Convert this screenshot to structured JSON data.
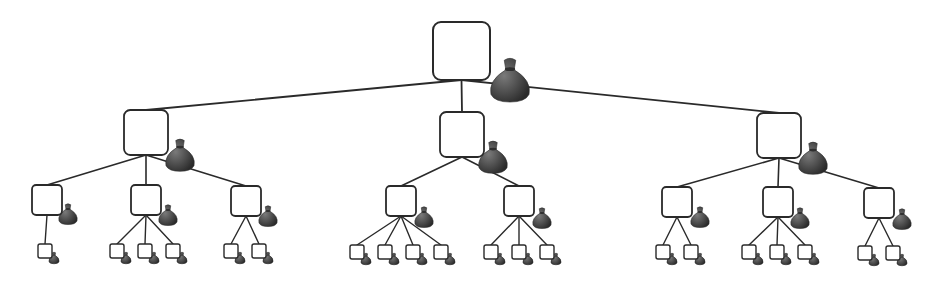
{
  "diagram": {
    "title": "",
    "colors": {
      "line": "#2a2a2a",
      "box_fill": "#ffffff",
      "bag": "#4a4a4a",
      "bag_dark": "#2e2e2e",
      "bag_light": "#6a6a6a"
    },
    "root": {
      "box": [
        433,
        22,
        57,
        58
      ],
      "bag": [
        510,
        84,
        19
      ],
      "children": [
        {
          "box": [
            124,
            110,
            44,
            45
          ],
          "bag": [
            180,
            158,
            14
          ],
          "children": [
            {
              "box": [
                32,
                185,
                30,
                30
              ],
              "bag": [
                68,
                216,
                9
              ],
              "leaves": [
                [
                  38,
                  244
                ]
              ]
            },
            {
              "box": [
                131,
                185,
                30,
                30
              ],
              "bag": [
                168,
                217,
                9
              ],
              "leaves": [
                [
                  110,
                  244
                ],
                [
                  138,
                  244
                ],
                [
                  166,
                  244
                ]
              ]
            },
            {
              "box": [
                231,
                186,
                30,
                30
              ],
              "bag": [
                268,
                218,
                9
              ],
              "leaves": [
                [
                  224,
                  244
                ],
                [
                  252,
                  244
                ]
              ]
            }
          ]
        },
        {
          "box": [
            440,
            112,
            44,
            45
          ],
          "bag": [
            493,
            160,
            14
          ],
          "children": [
            {
              "box": [
                386,
                186,
                30,
                30
              ],
              "bag": [
                424,
                219,
                9
              ],
              "leaves": [
                [
                  350,
                  245
                ],
                [
                  378,
                  245
                ],
                [
                  406,
                  245
                ],
                [
                  434,
                  245
                ]
              ]
            },
            {
              "box": [
                504,
                186,
                30,
                30
              ],
              "bag": [
                542,
                220,
                9
              ],
              "leaves": [
                [
                  484,
                  245
                ],
                [
                  512,
                  245
                ],
                [
                  540,
                  245
                ]
              ]
            }
          ]
        },
        {
          "box": [
            757,
            113,
            44,
            45
          ],
          "bag": [
            813,
            161,
            14
          ],
          "children": [
            {
              "box": [
                662,
                187,
                30,
                30
              ],
              "bag": [
                700,
                219,
                9
              ],
              "leaves": [
                [
                  656,
                  245
                ],
                [
                  684,
                  245
                ]
              ]
            },
            {
              "box": [
                763,
                187,
                30,
                30
              ],
              "bag": [
                800,
                220,
                9
              ],
              "leaves": [
                [
                  742,
                  245
                ],
                [
                  770,
                  245
                ],
                [
                  798,
                  245
                ]
              ]
            },
            {
              "box": [
                864,
                188,
                30,
                30
              ],
              "bag": [
                902,
                221,
                9
              ],
              "leaves": [
                [
                  858,
                  246
                ],
                [
                  886,
                  246
                ]
              ]
            }
          ]
        }
      ]
    },
    "leaf_size": 14,
    "leaf_bag_size": 5
  }
}
